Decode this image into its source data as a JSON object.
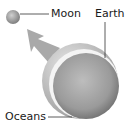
{
  "diagram": {
    "labels": {
      "moon": "Moon",
      "earth": "Earth",
      "oceans": "Oceans"
    },
    "colors": {
      "background": "#ffffff",
      "sphere_light": "#c8c8c8",
      "sphere_dark": "#7a7a7a",
      "ocean_rim": "#bdbdbd",
      "arrow": "#a9a9a9",
      "leader_line": "#333333",
      "text": "#1a1a1a"
    }
  }
}
